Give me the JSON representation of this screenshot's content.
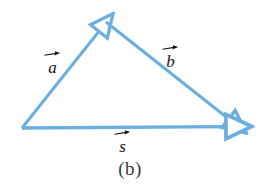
{
  "figure": {
    "caption": "(b)",
    "background_color": "#ffffff",
    "vector_color": "#6BAFE0",
    "label_color": "#141414",
    "caption_color": "#3a3a3a",
    "width": 260,
    "height": 186
  },
  "diagram": {
    "type": "vector-triangle",
    "vertices": {
      "tail": {
        "x": 22,
        "y": 128,
        "name": "origin-vertex"
      },
      "apex": {
        "x": 106,
        "y": 22,
        "name": "apex-vertex"
      },
      "head": {
        "x": 238,
        "y": 126,
        "name": "head-vertex"
      }
    },
    "vectors": [
      {
        "id": "a",
        "label": "a",
        "arrow_style": "open-triangle",
        "from": "tail",
        "to": "apex",
        "x1": 22,
        "y1": 128,
        "x2": 106,
        "y2": 22
      },
      {
        "id": "b",
        "label": "b",
        "arrow_style": "open-triangle",
        "from": "apex",
        "to": "head",
        "x1": 106,
        "y1": 22,
        "x2": 238,
        "y2": 126
      },
      {
        "id": "s",
        "label": "s",
        "arrow_style": "open-triangle",
        "from": "tail",
        "to": "head",
        "x1": 22,
        "y1": 128,
        "x2": 238,
        "y2": 126
      }
    ]
  },
  "labels": {
    "a": "a",
    "b": "b",
    "s": "s"
  }
}
